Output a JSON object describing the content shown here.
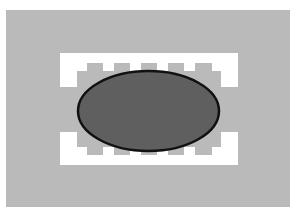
{
  "canvas": {
    "width": 295,
    "height": 212,
    "background": "#ffffff"
  },
  "colors": {
    "outer_fill": "#bababa",
    "band_fill": "#ffffff",
    "ellipse_fill": "#5f5f5f",
    "ellipse_stroke": "#111111"
  },
  "outer_rect": {
    "x": 6,
    "y": 10,
    "width": 284,
    "height": 197
  },
  "top_band": {
    "x": 60,
    "y": 53,
    "width": 178,
    "height": 34,
    "comb_outline": "M77,87 L77,71 L87,71 L87,63 L103,63 L103,71 L114,71 L114,63 L130,63 L130,71 L141,71 L141,63 L157,63 L157,71 L168,71 L168,63 L184,63 L184,71 L195,71 L195,63 L212,63 L212,71 L221,71 L221,87 Z"
  },
  "bottom_band": {
    "x": 60,
    "y": 132,
    "width": 178,
    "height": 33,
    "comb_outline": "M77,132 L77,147 L87,147 L87,155 L103,155 L103,147 L114,147 L114,155 L130,155 L130,147 L141,147 L141,155 L157,155 L157,147 L168,147 L168,155 L184,155 L184,147 L195,147 L195,155 L212,155 L212,147 L221,147 L221,132 Z"
  },
  "ellipse": {
    "cx": 148.5,
    "cy": 111,
    "rx": 70.5,
    "ry": 40,
    "stroke_width": 2.5
  }
}
